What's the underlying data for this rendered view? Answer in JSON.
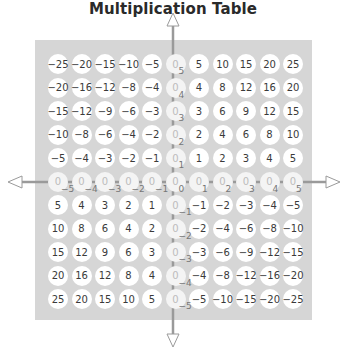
{
  "title": "Multiplication Table",
  "colors": {
    "panel": "#d6d6d6",
    "cell": "#ffffff",
    "zero_cell": "#f4f4f4",
    "axis": "#9a9a9a",
    "text": "#3a3a3a"
  },
  "axes": {
    "x_labels": [
      "-5",
      "-4",
      "-3",
      "-2",
      "-1",
      "0",
      "1",
      "2",
      "3",
      "4",
      "5"
    ],
    "y_labels": [
      "5",
      "4",
      "3",
      "2",
      "1",
      "0",
      "-1",
      "-2",
      "-3",
      "-4",
      "-5"
    ]
  },
  "grid": [
    [
      "−25",
      "−20",
      "−15",
      "−10",
      "−5",
      "0",
      "5",
      "10",
      "15",
      "20",
      "25"
    ],
    [
      "−20",
      "−16",
      "−12",
      "−8",
      "−4",
      "0",
      "4",
      "8",
      "12",
      "16",
      "20"
    ],
    [
      "−15",
      "−12",
      "−9",
      "−6",
      "−3",
      "0",
      "3",
      "6",
      "9",
      "12",
      "15"
    ],
    [
      "−10",
      "−8",
      "−6",
      "−4",
      "−2",
      "0",
      "2",
      "4",
      "6",
      "8",
      "10"
    ],
    [
      "−5",
      "−4",
      "−3",
      "−2",
      "−1",
      "0",
      "1",
      "2",
      "3",
      "4",
      "5"
    ],
    [
      "0",
      "0",
      "0",
      "0",
      "0",
      "0",
      "0",
      "0",
      "0",
      "0",
      "0"
    ],
    [
      "5",
      "4",
      "3",
      "2",
      "1",
      "0",
      "−1",
      "−2",
      "−3",
      "−4",
      "−5"
    ],
    [
      "10",
      "8",
      "6",
      "4",
      "2",
      "0",
      "−2",
      "−4",
      "−6",
      "−8",
      "−10"
    ],
    [
      "15",
      "12",
      "9",
      "6",
      "3",
      "0",
      "−3",
      "−6",
      "−9",
      "−12",
      "−15"
    ],
    [
      "20",
      "16",
      "12",
      "8",
      "4",
      "0",
      "−4",
      "−8",
      "−12",
      "−16",
      "−20"
    ],
    [
      "25",
      "20",
      "15",
      "10",
      "5",
      "0",
      "−5",
      "−10",
      "−15",
      "−20",
      "−25"
    ]
  ],
  "axis_subscripts": {
    "horizontal": [
      "−5",
      "−4",
      "−3",
      "−2",
      "−1",
      "0",
      "1",
      "2",
      "3",
      "4",
      "5"
    ],
    "vertical": [
      "5",
      "4",
      "3",
      "2",
      "1",
      "0",
      "−1",
      "−2",
      "−3",
      "−4",
      "−5"
    ]
  }
}
